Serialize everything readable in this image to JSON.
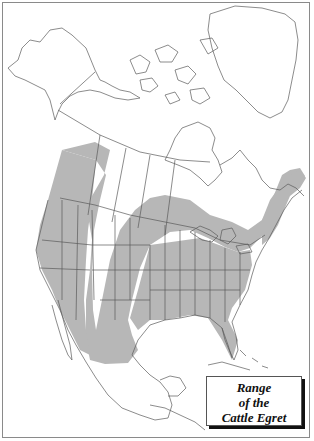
{
  "map": {
    "title_lines": [
      "Range",
      "of the",
      "Cattle Egret"
    ],
    "region": "North America",
    "colors": {
      "range_fill": "#b7b7b7",
      "outline": "#5a5a5a",
      "land": "#ffffff",
      "frame": "#8a8a8a"
    },
    "legend": {
      "position": "bottom-right",
      "style": "boxed italic serif with drop shadow"
    }
  }
}
